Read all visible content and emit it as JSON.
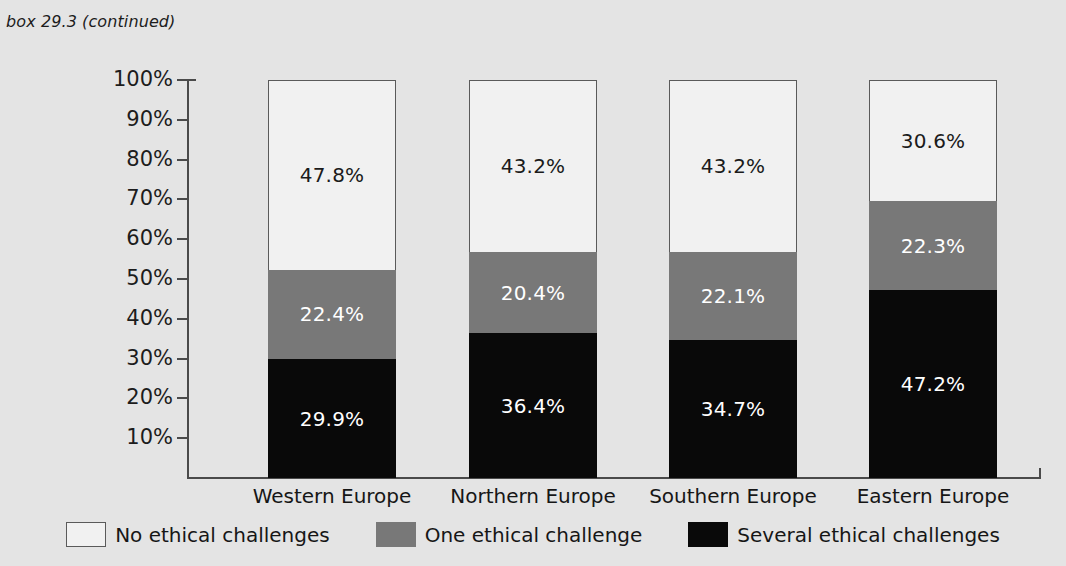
{
  "caption": "box 29.3 (continued)",
  "chart_data": {
    "type": "bar",
    "subtype": "stacked-100-percent",
    "title": "box 29.3 (continued)",
    "xlabel": "",
    "ylabel": "",
    "ylim": [
      0,
      100
    ],
    "grid": false,
    "legend_position": "bottom",
    "categories": [
      "Western Europe",
      "Northern Europe",
      "Southern Europe",
      "Eastern Europe"
    ],
    "ytick_labels": [
      "100%",
      "90%",
      "80%",
      "70%",
      "60%",
      "50%",
      "40%",
      "30%",
      "20%",
      "10%"
    ],
    "ytick_values": [
      100,
      90,
      80,
      70,
      60,
      50,
      40,
      30,
      20,
      10
    ],
    "series": [
      {
        "name": "Several ethical challenges",
        "color": "#090909",
        "values": [
          29.9,
          36.4,
          34.7,
          47.2
        ],
        "labels": [
          "29.9%",
          "36.4%",
          "34.7%",
          "47.2%"
        ]
      },
      {
        "name": "One ethical challenge",
        "color": "#787878",
        "values": [
          22.4,
          20.4,
          22.1,
          22.3
        ],
        "labels": [
          "22.4%",
          "20.4%",
          "22.1%",
          "22.3%"
        ]
      },
      {
        "name": "No ethical challenges",
        "color": "#f1f1f1",
        "values": [
          47.8,
          43.2,
          43.2,
          30.6
        ],
        "labels": [
          "47.8%",
          "43.2%",
          "43.2%",
          "30.6%"
        ]
      }
    ]
  },
  "legend": [
    {
      "label": "No ethical challenges",
      "swatch": "white-swatch"
    },
    {
      "label": "One ethical challenge",
      "swatch": "gray-swatch"
    },
    {
      "label": "Several ethical challenges",
      "swatch": "black-swatch"
    }
  ],
  "colors": {
    "background": "#e4e4e4",
    "axis": "#4a4a4a",
    "no_challenges": "#f1f1f1",
    "one_challenge": "#787878",
    "several_challenges": "#090909",
    "text": "#161616"
  }
}
